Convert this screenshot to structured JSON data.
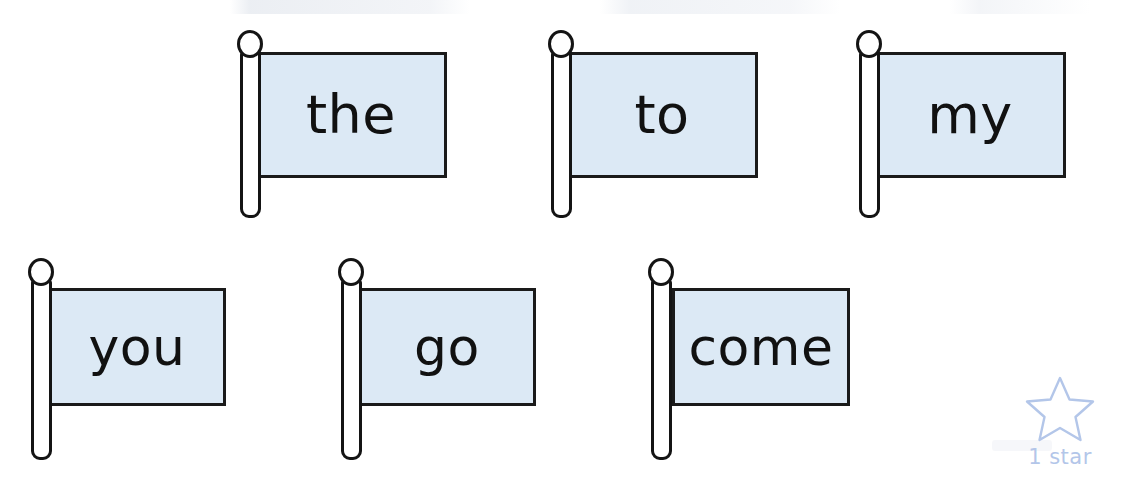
{
  "page": {
    "background_color": "#ffffff",
    "width": 1140,
    "height": 479
  },
  "style": {
    "banner_fill": "#dce9f5",
    "banner_stroke": "#1a1a1a",
    "pole_fill": "#ffffff",
    "pole_stroke": "#141414",
    "word_color": "#111111",
    "star_color": "#b3c6e9"
  },
  "flags": [
    {
      "word": "the",
      "row": 1,
      "pole_x": 237,
      "pole_top": 30,
      "pole_height": 188,
      "banner_x": 255,
      "banner_y": 52,
      "banner_width": 192,
      "banner_height": 126,
      "font_size": 54
    },
    {
      "word": "to",
      "row": 1,
      "pole_x": 548,
      "pole_top": 30,
      "pole_height": 188,
      "banner_x": 566,
      "banner_y": 52,
      "banner_width": 192,
      "banner_height": 126,
      "font_size": 54
    },
    {
      "word": "my",
      "row": 1,
      "pole_x": 856,
      "pole_top": 30,
      "pole_height": 188,
      "banner_x": 874,
      "banner_y": 52,
      "banner_width": 192,
      "banner_height": 126,
      "font_size": 54
    },
    {
      "word": "you",
      "row": 2,
      "pole_x": 28,
      "pole_top": 258,
      "pole_height": 202,
      "banner_x": 48,
      "banner_y": 288,
      "banner_width": 178,
      "banner_height": 118,
      "font_size": 52
    },
    {
      "word": "go",
      "row": 2,
      "pole_x": 338,
      "pole_top": 258,
      "pole_height": 202,
      "banner_x": 358,
      "banner_y": 288,
      "banner_width": 178,
      "banner_height": 118,
      "font_size": 52
    },
    {
      "word": "come",
      "row": 2,
      "pole_x": 648,
      "pole_top": 258,
      "pole_height": 202,
      "banner_x": 672,
      "banner_y": 288,
      "banner_width": 178,
      "banner_height": 118,
      "font_size": 52
    }
  ],
  "star_badge": {
    "label": "1 star",
    "x": 1000,
    "y": 374,
    "icon": "star-outline-icon",
    "color": "#b3c6e9"
  }
}
